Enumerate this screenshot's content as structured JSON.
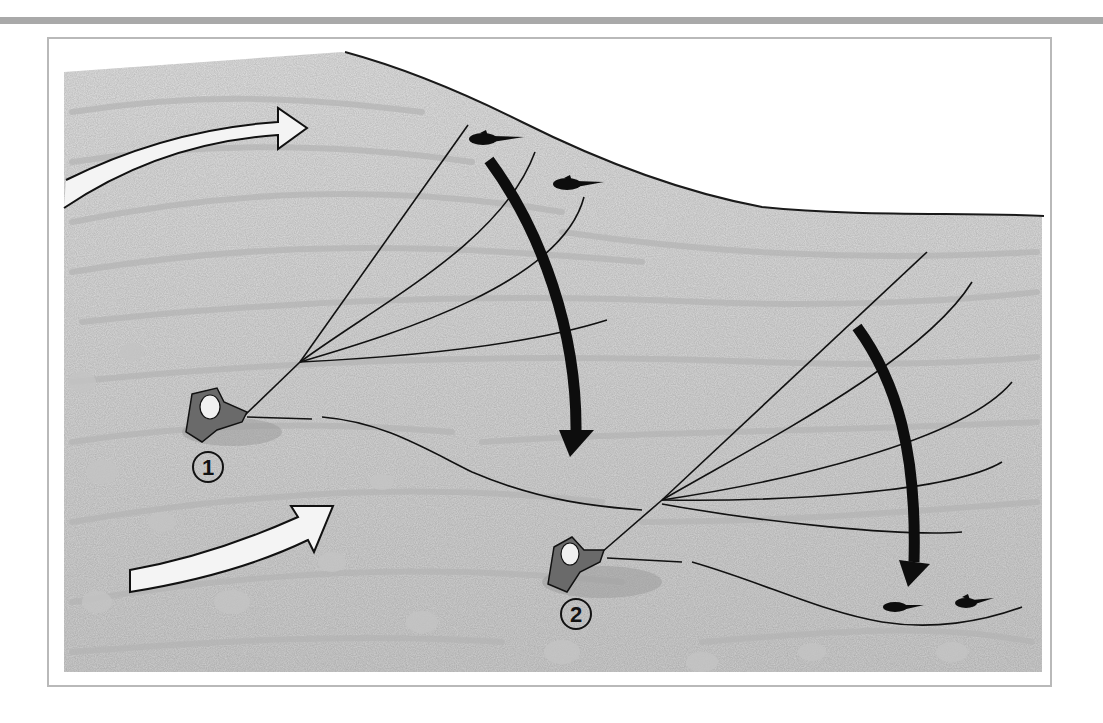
{
  "figure": {
    "type": "fly-fishing swing diagram",
    "background_color": "#ffffff",
    "water_color": "#d6d6d6",
    "bank_line_color": "#1a1a1a",
    "rule_color": "#a9a9a9",
    "frame_border_color": "#b9b9b9"
  },
  "markers": [
    {
      "id": "angler-1",
      "label": "1"
    },
    {
      "id": "angler-2",
      "label": "2"
    }
  ],
  "arrows": {
    "current": [
      {
        "id": "current-arrow-upper",
        "style": "outline",
        "direction": "right"
      },
      {
        "id": "current-arrow-lower",
        "style": "outline",
        "direction": "up-right"
      }
    ],
    "swing": [
      {
        "id": "swing-arrow-1",
        "style": "solid-black",
        "direction": "down"
      },
      {
        "id": "swing-arrow-2",
        "style": "solid-black",
        "direction": "down"
      }
    ]
  },
  "fish": [
    {
      "id": "fish-1",
      "position": "upper-left near bank"
    },
    {
      "id": "fish-2",
      "position": "upper near bank"
    },
    {
      "id": "fish-3",
      "position": "lower-right"
    },
    {
      "id": "fish-4",
      "position": "lower-right"
    }
  ]
}
